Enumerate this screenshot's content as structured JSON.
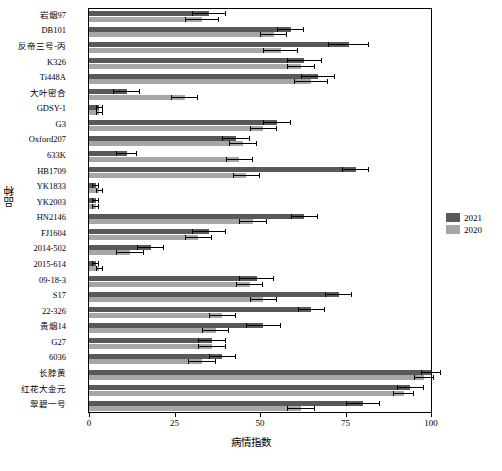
{
  "chart_data": {
    "type": "bar",
    "orientation": "horizontal",
    "title": "",
    "xlabel": "病情指数",
    "ylabel": "品种",
    "xlim": [
      0,
      100
    ],
    "xticks": [
      0,
      25,
      50,
      75,
      100
    ],
    "xticklabels": [
      "0",
      "25",
      "50",
      "75",
      "100"
    ],
    "grid": false,
    "legend_position": "right",
    "categories": [
      "岩烟97",
      "DB101",
      "反帝三号-丙",
      "K326",
      "Ti448A",
      "大叶密合",
      "GDSY-1",
      "G3",
      "Oxford207",
      "633K",
      "HB1709",
      "YK1833",
      "YK2003",
      "HN2146",
      "FJ1604",
      "2014-502",
      "2015-614",
      "09-18-3",
      "S17",
      "22-326",
      "贵烟14",
      "G27",
      "6036",
      "长脖黄",
      "红花大金元",
      "翠碧一号"
    ],
    "series": [
      {
        "name": "2021",
        "color": "#595959",
        "values": [
          35,
          59,
          76,
          63,
          67,
          11,
          3,
          55,
          43,
          11,
          78,
          2,
          2,
          63,
          35,
          18,
          2,
          49,
          73,
          65,
          51,
          36,
          39,
          100,
          94,
          80
        ],
        "errors": [
          5,
          4,
          6,
          5,
          5,
          4,
          1,
          4,
          4,
          3,
          4,
          1,
          1,
          4,
          5,
          4,
          1,
          5,
          4,
          4,
          5,
          4,
          4,
          3,
          4,
          5
        ]
      },
      {
        "name": "2020",
        "color": "#a6a6a6",
        "values": [
          33,
          54,
          56,
          62,
          65,
          28,
          3,
          51,
          45,
          44,
          46,
          3,
          2,
          48,
          32,
          12,
          3,
          47,
          51,
          39,
          37,
          36,
          33,
          98,
          92,
          62
        ],
        "errors": [
          5,
          4,
          5,
          4,
          5,
          4,
          1,
          4,
          4,
          4,
          4,
          1,
          1,
          4,
          4,
          4,
          1,
          4,
          4,
          4,
          4,
          4,
          4,
          3,
          3,
          4
        ]
      }
    ]
  }
}
